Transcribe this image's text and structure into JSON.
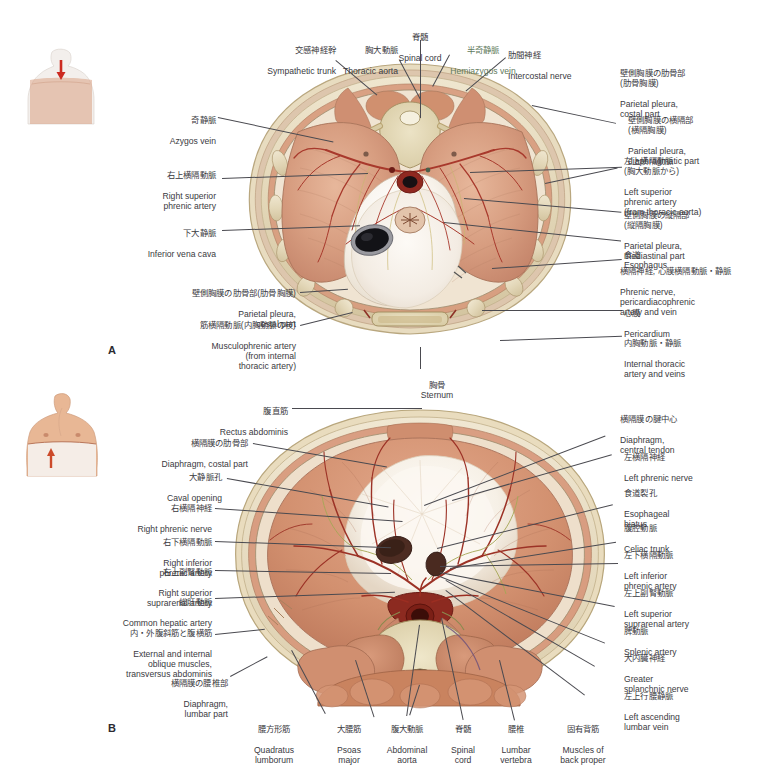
{
  "page": {
    "background": "#ffffff",
    "text_color": "#3a3a41",
    "accent_green": "#5f7a5c"
  },
  "panels": [
    {
      "id": "A",
      "letter": "A",
      "view": "superior-view-of-diaphragm",
      "thumbnail": {
        "name": "torso-thumbnail-superior",
        "arrow_direction": "down",
        "arrow_color": "#cc2a20"
      }
    },
    {
      "id": "B",
      "letter": "B",
      "view": "inferior-view-of-diaphragm",
      "thumbnail": {
        "name": "torso-thumbnail-inferior",
        "arrow_direction": "up",
        "arrow_color": "#cc4a2a"
      }
    }
  ],
  "labels_a": {
    "sympathetic_trunk": {
      "jp": "交感神経幹",
      "en": "Sympathetic trunk"
    },
    "thoracic_aorta": {
      "jp": "胸大動脈",
      "en": "Thoracic aorta"
    },
    "spinal_cord": {
      "jp": "脊髄",
      "en": "Spinal cord"
    },
    "hemiazygos_vein": {
      "jp": "半奇静脈",
      "en": "Hemiazygos vein"
    },
    "intercostal_nerve": {
      "jp": "肋間神経",
      "en": "Intercostal nerve"
    },
    "azygos_vein": {
      "jp": "奇静脈",
      "en": "Azygos vein"
    },
    "right_superior_phrenic_artery": {
      "jp": "右上横隔動脈",
      "en": "Right superior\nphrenic artery"
    },
    "inferior_vena_cava": {
      "jp": "下大静脈",
      "en": "Inferior vena cava"
    },
    "parietal_pleura_costal_left": {
      "jp": "壁側胸膜の肋骨部(肋骨胸膜)",
      "en": "Parietal pleura,\ncostal part"
    },
    "musculophrenic_artery": {
      "jp": "筋横隔動脈(内胸動脈の枝)",
      "en": "Musculophrenic artery\n(from internal\nthoracic artery)"
    },
    "parietal_pleura_costal_right": {
      "jp": "壁側胸膜の肋骨部\n(肋骨胸膜)",
      "en": "Parietal pleura,\ncostal part"
    },
    "parietal_pleura_diaphragmatic": {
      "jp": "壁側胸膜の横隔部\n(横隔胸膜)",
      "en": "Parietal pleura,\ndiaphragmatic part"
    },
    "left_superior_phrenic_artery": {
      "jp": "左上横隔動脈\n(胸大動脈から)",
      "en": "Left superior\nphrenic artery\n(from thoracic aorta)"
    },
    "parietal_pleura_mediastinal": {
      "jp": "壁側胸膜の縦隔部\n(縦隔胸膜)",
      "en": "Parietal pleura,\nmediastinal part"
    },
    "esophagus": {
      "jp": "食道",
      "en": "Esophagus"
    },
    "phrenic_nerve": {
      "jp": "横隔神経, 心膜横隔動脈・静脈",
      "en": "Phrenic nerve,\npericardiacophrenic\nartery and vein"
    },
    "pericardium": {
      "jp": "心膜",
      "en": "Pericardium"
    },
    "internal_thoracic": {
      "jp": "内胸動脈・静脈",
      "en": "Internal thoracic\nartery and veins"
    },
    "sternum": {
      "jp": "胸骨",
      "en": "Sternum"
    }
  },
  "labels_b": {
    "rectus_abdominis": {
      "jp": "腹直筋",
      "en": "Rectus abdominis"
    },
    "diaphragm_costal": {
      "jp": "横隔膜の肋骨部",
      "en": "Diaphragm, costal part"
    },
    "caval_opening": {
      "jp": "大静脈孔",
      "en": "Caval opening"
    },
    "right_phrenic_nerve": {
      "jp": "右横隔神経",
      "en": "Right phrenic nerve"
    },
    "right_inferior_phrenic_artery": {
      "jp": "右下横隔動脈",
      "en": "Right inferior\nphrenic artery"
    },
    "right_superior_suprarenal_artery": {
      "jp": "右上副腎動脈",
      "en": "Right superior\nsuprarenal artery"
    },
    "common_hepatic_artery": {
      "jp": "総肝動脈",
      "en": "Common hepatic artery"
    },
    "oblique_muscles": {
      "jp": "内・外腹斜筋と腹横筋",
      "en": "External and internal\noblique muscles,\ntransversus abdominis"
    },
    "diaphragm_lumbar": {
      "jp": "横隔膜の腰椎部",
      "en": "Diaphragm,\nlumbar part"
    },
    "diaphragm_central_tendon": {
      "jp": "横隔膜の腱中心",
      "en": "Diaphragm,\ncentral tendon"
    },
    "left_phrenic_nerve": {
      "jp": "左横隔神経",
      "en": "Left phrenic nerve"
    },
    "esophageal_hiatus": {
      "jp": "食道裂孔",
      "en": "Esophageal\nhiatus"
    },
    "celiac_trunk": {
      "jp": "腹腔動脈",
      "en": "Celiac trunk"
    },
    "left_inferior_phrenic_artery": {
      "jp": "左下横隔動脈",
      "en": "Left inferior\nphrenic artery"
    },
    "left_superior_suprarenal_artery": {
      "jp": "左上副腎動脈",
      "en": "Left superior\nsuprarenal artery"
    },
    "splenic_artery": {
      "jp": "脾動脈",
      "en": "Splenic artery"
    },
    "greater_splanchnic_nerve": {
      "jp": "大内臓神経",
      "en": "Greater\nsplanchnic nerve"
    },
    "left_ascending_lumbar_vein": {
      "jp": "左上行腰静脈",
      "en": "Left ascending\nlumbar vein"
    },
    "quadratus_lumborum": {
      "jp": "腰方形筋",
      "en": "Quadratus\nlumborum"
    },
    "psoas_major": {
      "jp": "大腰筋",
      "en": "Psoas\nmajor"
    },
    "abdominal_aorta": {
      "jp": "腹大動脈",
      "en": "Abdominal\naorta"
    },
    "spinal_cord": {
      "jp": "脊髄",
      "en": "Spinal\ncord"
    },
    "lumbar_vertebra": {
      "jp": "腰椎",
      "en": "Lumbar\nvertebra"
    },
    "muscles_back_proper": {
      "jp": "固有背筋",
      "en": "Muscles of\nback proper"
    }
  }
}
